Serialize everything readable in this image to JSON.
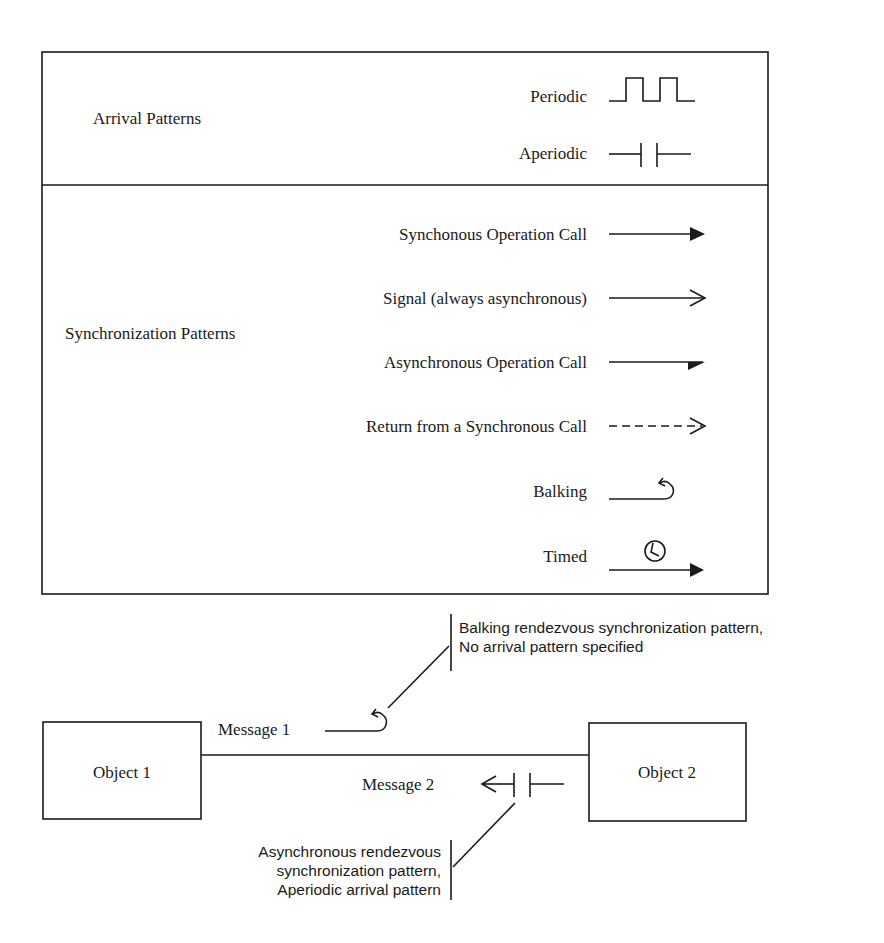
{
  "legend": {
    "arrival": {
      "heading": "Arrival Patterns",
      "items": [
        {
          "label": "Periodic",
          "icon": "periodic-square-wave-icon"
        },
        {
          "label": "Aperiodic",
          "icon": "aperiodic-bars-icon"
        }
      ]
    },
    "synchronization": {
      "heading": "Synchronization Patterns",
      "items": [
        {
          "label": "Synchonous Operation Call",
          "icon": "filled-arrow-icon"
        },
        {
          "label": "Signal (always asynchronous)",
          "icon": "open-arrow-icon"
        },
        {
          "label": "Asynchronous Operation Call",
          "icon": "half-arrow-icon"
        },
        {
          "label": "Return from a Synchronous Call",
          "icon": "dashed-arrow-icon"
        },
        {
          "label": "Balking",
          "icon": "balking-hook-icon"
        },
        {
          "label": "Timed",
          "icon": "timed-clock-arrow-icon"
        }
      ]
    }
  },
  "example": {
    "object1": "Object 1",
    "object2": "Object 2",
    "message1": "Message 1",
    "message2": "Message 2",
    "note_top": [
      "Balking rendezvous synchronization pattern,",
      "No arrival pattern specified"
    ],
    "note_bottom": [
      "Asynchronous rendezvous",
      "synchronization pattern,",
      "Aperiodic arrival pattern"
    ]
  }
}
